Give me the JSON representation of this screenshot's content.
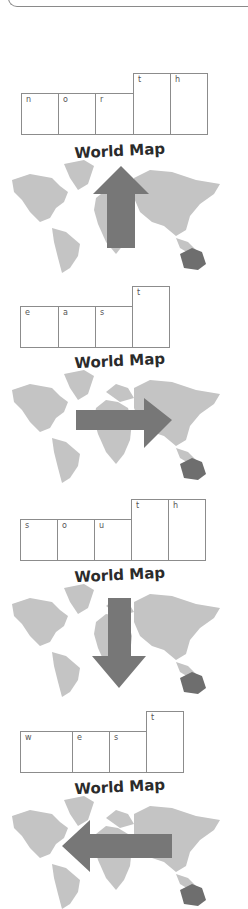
{
  "worksheet": {
    "sections": [
      {
        "word": "north",
        "letters": [
          "n",
          "o",
          "r",
          "t",
          "h"
        ],
        "map_title": "World Map",
        "arrow_direction": "up"
      },
      {
        "word": "east",
        "letters": [
          "e",
          "a",
          "s",
          "t"
        ],
        "map_title": "World Map",
        "arrow_direction": "right"
      },
      {
        "word": "south",
        "letters": [
          "s",
          "o",
          "u",
          "t",
          "h"
        ],
        "map_title": "World Map",
        "arrow_direction": "down"
      },
      {
        "word": "west",
        "letters": [
          "w",
          "e",
          "s",
          "t"
        ],
        "map_title": "World Map",
        "arrow_direction": "left"
      }
    ],
    "colors": {
      "box_border": "#8c8c8c",
      "land": "#c4c4c4",
      "land_dark": "#6e6e6e",
      "arrow": "#777777",
      "title": "#2b2b2b"
    }
  }
}
